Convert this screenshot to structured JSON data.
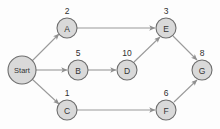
{
  "diagram": {
    "background_color": "#fdfdfd",
    "node_fill_color": "#d9d9d9",
    "node_stroke_color": "#6d6d6d",
    "edge_color": "#9a9a9a",
    "text_color": "#333333",
    "nodes": [
      {
        "id": "start",
        "label": "Start",
        "weight": "",
        "cx": 22,
        "cy": 70,
        "r": 14,
        "label_size": "start"
      },
      {
        "id": "a",
        "label": "A",
        "weight": "2",
        "cx": 67,
        "cy": 28,
        "r": 10,
        "label_size": "small"
      },
      {
        "id": "b",
        "label": "B",
        "weight": "5",
        "cx": 78,
        "cy": 70,
        "r": 10,
        "label_size": "small"
      },
      {
        "id": "c",
        "label": "C",
        "weight": "1",
        "cx": 67,
        "cy": 110,
        "r": 10,
        "label_size": "small"
      },
      {
        "id": "d",
        "label": "D",
        "weight": "10",
        "cx": 127,
        "cy": 70,
        "r": 10,
        "label_size": "small"
      },
      {
        "id": "e",
        "label": "E",
        "weight": "3",
        "cx": 166,
        "cy": 28,
        "r": 10,
        "label_size": "small"
      },
      {
        "id": "f",
        "label": "F",
        "weight": "6",
        "cx": 166,
        "cy": 110,
        "r": 10,
        "label_size": "small"
      },
      {
        "id": "g",
        "label": "G",
        "weight": "8",
        "cx": 202,
        "cy": 70,
        "r": 10,
        "label_size": "small"
      }
    ],
    "weight_labels": [
      {
        "for": "a",
        "text": "2",
        "x": 67,
        "y": 11
      },
      {
        "for": "b",
        "text": "5",
        "x": 78,
        "y": 53
      },
      {
        "for": "c",
        "text": "1",
        "x": 67,
        "y": 93
      },
      {
        "for": "d",
        "text": "10",
        "x": 127,
        "y": 53
      },
      {
        "for": "e",
        "text": "3",
        "x": 166,
        "y": 11
      },
      {
        "for": "f",
        "text": "6",
        "x": 166,
        "y": 93
      },
      {
        "for": "g",
        "text": "8",
        "x": 202,
        "y": 53
      }
    ],
    "edges": [
      {
        "id": "start-a",
        "from": "start",
        "to": "a",
        "x1": 32,
        "y1": 61,
        "x2": 59,
        "y2": 34
      },
      {
        "id": "start-b",
        "from": "start",
        "to": "b",
        "x1": 36,
        "y1": 70,
        "x2": 67,
        "y2": 70
      },
      {
        "id": "start-c",
        "from": "start",
        "to": "c",
        "x1": 32,
        "y1": 79,
        "x2": 59,
        "y2": 104
      },
      {
        "id": "a-e",
        "from": "a",
        "to": "e",
        "x1": 77,
        "y1": 28,
        "x2": 155,
        "y2": 28
      },
      {
        "id": "b-d",
        "from": "b",
        "to": "d",
        "x1": 88,
        "y1": 70,
        "x2": 116,
        "y2": 70
      },
      {
        "id": "c-f",
        "from": "c",
        "to": "f",
        "x1": 77,
        "y1": 110,
        "x2": 155,
        "y2": 110
      },
      {
        "id": "d-e",
        "from": "d",
        "to": "e",
        "x1": 134,
        "y1": 62,
        "x2": 160,
        "y2": 37
      },
      {
        "id": "e-g",
        "from": "e",
        "to": "g",
        "x1": 173,
        "y1": 36,
        "x2": 197,
        "y2": 60
      },
      {
        "id": "f-g",
        "from": "f",
        "to": "g",
        "x1": 174,
        "y1": 102,
        "x2": 197,
        "y2": 80
      }
    ]
  }
}
